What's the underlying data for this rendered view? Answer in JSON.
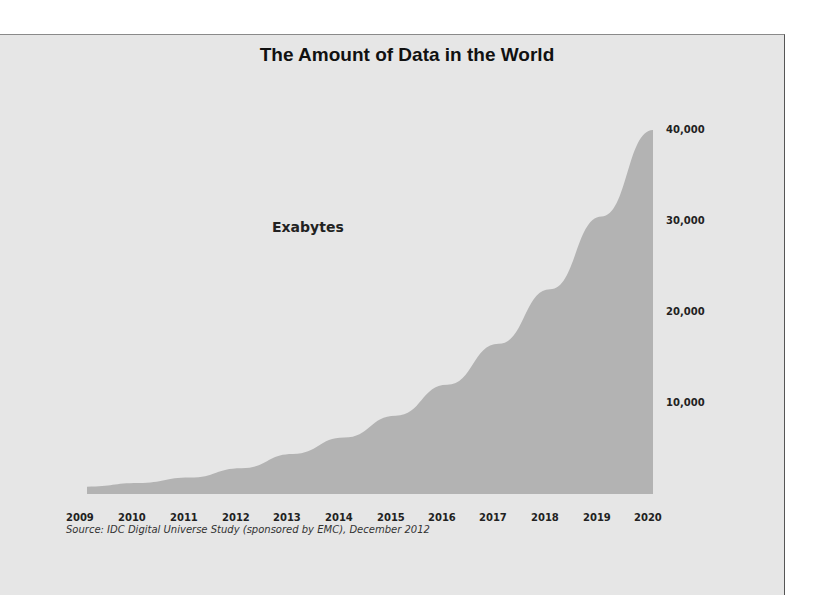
{
  "title": "The Amount of Data in the World",
  "unit_label": "Exabytes",
  "source": "Source: IDC Digital Universe Study (sponsored by EMC), December 2012",
  "y_ticks": [
    "10,000",
    "20,000",
    "30,000",
    "40,000"
  ],
  "x_ticks": [
    "2009",
    "2010",
    "2011",
    "2012",
    "2013",
    "2014",
    "2015",
    "2016",
    "2017",
    "2018",
    "2019",
    "2020"
  ],
  "colors": {
    "panel": "#e6e6e6",
    "area": "#b3b3b3",
    "text": "#222222"
  },
  "chart_data": {
    "type": "area",
    "title": "The Amount of Data in the World",
    "xlabel": "",
    "ylabel": "Exabytes",
    "categories": [
      "2009",
      "2010",
      "2011",
      "2012",
      "2013",
      "2014",
      "2015",
      "2016",
      "2017",
      "2018",
      "2019",
      "2020"
    ],
    "values": [
      800,
      1200,
      1800,
      2837,
      4400,
      6200,
      8600,
      12000,
      16500,
      22500,
      30500,
      40000
    ],
    "ylim": [
      0,
      40000
    ],
    "y_ticks": [
      10000,
      20000,
      30000,
      40000
    ],
    "y_axis_position": "right",
    "grid": false,
    "legend": "none",
    "annotations": [
      "Exabytes",
      "Source: IDC Digital Universe Study (sponsored by EMC), December 2012"
    ]
  }
}
